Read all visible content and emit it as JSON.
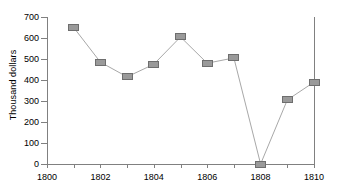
{
  "chart_data": {
    "type": "line",
    "title": "",
    "subtitle": "",
    "xlabel": "",
    "ylabel": "Thousand dollars",
    "x": [
      1801,
      1802,
      1803,
      1804,
      1805,
      1806,
      1807,
      1808,
      1809,
      1810
    ],
    "values": [
      650,
      485,
      415,
      475,
      605,
      480,
      505,
      0,
      305,
      390
    ],
    "series": [
      {
        "name": "",
        "values": [
          650,
          485,
          415,
          475,
          605,
          480,
          505,
          0,
          305,
          390
        ]
      }
    ],
    "xlim": [
      1800,
      1810
    ],
    "ylim": [
      0,
      700
    ],
    "x_ticks": [
      1800,
      1801,
      1802,
      1803,
      1804,
      1805,
      1806,
      1807,
      1808,
      1809,
      1810
    ],
    "x_tick_labels": [
      "1800",
      "",
      "1802",
      "",
      "1804",
      "",
      "1806",
      "",
      "1808",
      "",
      "1810"
    ],
    "y_ticks": [
      0,
      100,
      200,
      300,
      400,
      500,
      600,
      700
    ],
    "y_tick_labels": [
      "0",
      "100",
      "200",
      "300",
      "400",
      "500",
      "600",
      "700"
    ],
    "grid": false,
    "legend": false,
    "legend_position": "none",
    "marker_shape": "square",
    "marker_color": "#9a9a9a",
    "marker_border_color": "#6e6e6e",
    "line_color": "#a8a8a8",
    "axis_color": "#808080",
    "background_color": "#ffffff",
    "text_color": "#000000"
  }
}
